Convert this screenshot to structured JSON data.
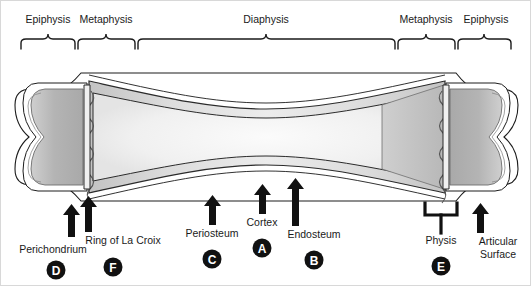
{
  "figure": {
    "regions_top": [
      {
        "id": "epiphysis-left",
        "label": "Epiphysis",
        "x": 100,
        "tick_x": 47,
        "span": [
          20,
          74
        ]
      },
      {
        "id": "metaphysis-left",
        "label": "Metaphysis",
        "x": 176,
        "tick_x": 105,
        "span": [
          76,
          134
        ]
      },
      {
        "id": "diaphysis",
        "label": "Diaphysis",
        "x": 265,
        "tick_x": 265,
        "span": [
          136,
          394
        ]
      },
      {
        "id": "metaphysis-right",
        "label": "Metaphysis",
        "x": 421,
        "tick_x": 425,
        "span": [
          396,
          454
        ]
      },
      {
        "id": "epiphysis-right",
        "label": "Epiphysis",
        "x": 489,
        "tick_x": 483,
        "span": [
          456,
          510
        ]
      }
    ],
    "callouts": [
      {
        "id": "perichondrium",
        "label": "Perichondrium",
        "badge": "D",
        "label_x": 52,
        "label_y": 252,
        "badge_x": 55,
        "badge_y": 270,
        "arrow_x": 70,
        "arrow_top": 205,
        "arrow_bottom": 238,
        "style": "arrow"
      },
      {
        "id": "ring-of-la-croix",
        "label": "Ring of La Croix",
        "badge": "F",
        "label_x": 120,
        "label_y": 242,
        "badge_x": 111,
        "badge_y": 266,
        "arrow_x": 87,
        "arrow_top": 196,
        "arrow_bottom": 231,
        "style": "arrow"
      },
      {
        "id": "periosteum",
        "label": "Periosteum",
        "badge": "C",
        "label_x": 211,
        "label_y": 235,
        "badge_x": 211,
        "badge_y": 259,
        "arrow_x": 211,
        "arrow_top": 196,
        "arrow_bottom": 225,
        "style": "arrow"
      },
      {
        "id": "cortex",
        "label": "Cortex",
        "badge": "A",
        "label_x": 261,
        "label_y": 224,
        "badge_x": 261,
        "badge_y": 248,
        "arrow_x": 261,
        "arrow_top": 184,
        "arrow_bottom": 214,
        "style": "arrow"
      },
      {
        "id": "endosteum",
        "label": "Endosteum",
        "badge": "B",
        "label_x": 311,
        "label_y": 236,
        "badge_x": 311,
        "badge_y": 260,
        "arrow_x": 294,
        "arrow_top": 178,
        "arrow_bottom": 226,
        "style": "arrow"
      },
      {
        "id": "physis",
        "label": "Physis",
        "badge": "E",
        "label_x": 440,
        "label_y": 242,
        "badge_x": 440,
        "badge_y": 264,
        "arrow_x": 440,
        "arrow_top": 200,
        "arrow_bottom": 232,
        "style": "bracket"
      },
      {
        "id": "articular-surface",
        "label": "Articular",
        "label2": "Surface",
        "badge": "",
        "label_x": 497,
        "label_y": 243,
        "label2_y": 256,
        "arrow_x": 479,
        "arrow_top": 204,
        "arrow_bottom": 232,
        "style": "arrow"
      }
    ],
    "colors": {
      "ink": "#1a1a1a",
      "badge_fill": "#111111",
      "badge_text": "#ffffff",
      "cortex_line": "#2b2b2b",
      "epiphysis_fill": "#b9b9b9",
      "metaphysis_fill": "#c9c9c9",
      "diaphysis_fill": "#e8e8e8",
      "marrow_fill": "#f4f4f4",
      "outline": "#1c1c1c",
      "periosteum_fill": "#ffffff"
    }
  }
}
